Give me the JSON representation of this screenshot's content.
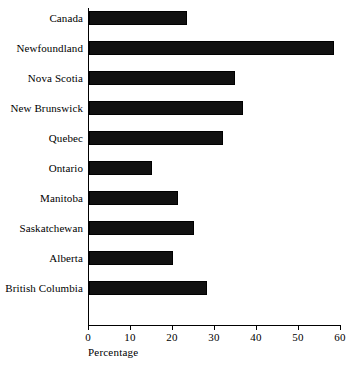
{
  "chart_data": {
    "type": "bar",
    "orientation": "horizontal",
    "title": "",
    "xlabel": "Percentage",
    "ylabel": "",
    "xlim": [
      0,
      60
    ],
    "xticks": [
      0,
      10,
      20,
      30,
      40,
      50,
      60
    ],
    "grid": false,
    "legend": null,
    "bar_color": "#111111",
    "categories": [
      "Canada",
      "Newfoundland",
      "Nova Scotia",
      "New Brunswick",
      "Quebec",
      "Ontario",
      "Manitoba",
      "Saskatchewan",
      "Alberta",
      "British Columbia"
    ],
    "values": [
      23.3,
      58.3,
      34.8,
      36.7,
      32.0,
      15.0,
      21.2,
      25.0,
      20.0,
      28.0
    ]
  },
  "axis": {
    "x_title": "Percentage",
    "tick_labels": [
      "0",
      "10",
      "20",
      "30",
      "40",
      "50",
      "60"
    ]
  },
  "caption_fragment": ""
}
